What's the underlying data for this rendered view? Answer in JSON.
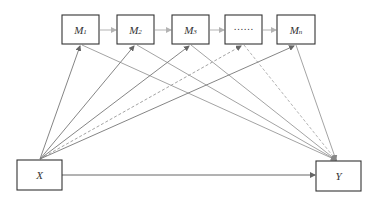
{
  "diagram": {
    "type": "multiple serial mediation model",
    "nodes": {
      "m1": {
        "main": "M",
        "sub": "1"
      },
      "m2": {
        "main": "M",
        "sub": "2"
      },
      "m3": {
        "main": "M",
        "sub": "3"
      },
      "ellipsis": {
        "main": "……",
        "sub": ""
      },
      "mn": {
        "main": "M",
        "sub": "n"
      },
      "x": {
        "main": "X",
        "sub": ""
      },
      "y": {
        "main": "Y",
        "sub": ""
      }
    },
    "edges": [
      {
        "from": "M1",
        "to": "M2",
        "style": "solid",
        "color": "#b3b3b3"
      },
      {
        "from": "M2",
        "to": "M3",
        "style": "solid",
        "color": "#b3b3b3"
      },
      {
        "from": "M3",
        "to": "……",
        "style": "solid",
        "color": "#b3b3b3"
      },
      {
        "from": "……",
        "to": "Mn",
        "style": "solid",
        "color": "#b3b3b3"
      },
      {
        "from": "X",
        "to": "M1",
        "style": "solid",
        "color": "#777777"
      },
      {
        "from": "X",
        "to": "M2",
        "style": "solid",
        "color": "#777777"
      },
      {
        "from": "X",
        "to": "M3",
        "style": "solid",
        "color": "#777777"
      },
      {
        "from": "X",
        "to": "……",
        "style": "dashed",
        "color": "#999999"
      },
      {
        "from": "X",
        "to": "Mn",
        "style": "solid",
        "color": "#777777"
      },
      {
        "from": "M1",
        "to": "Y",
        "style": "solid",
        "color": "#999999"
      },
      {
        "from": "M2",
        "to": "Y",
        "style": "solid",
        "color": "#999999"
      },
      {
        "from": "M3",
        "to": "Y",
        "style": "solid",
        "color": "#999999"
      },
      {
        "from": "……",
        "to": "Y",
        "style": "dashed",
        "color": "#aaaaaa"
      },
      {
        "from": "Mn",
        "to": "Y",
        "style": "solid",
        "color": "#999999"
      },
      {
        "from": "X",
        "to": "Y",
        "style": "solid",
        "color": "#666666"
      }
    ],
    "colors": {
      "box_border": "#333333",
      "chain_arrow": "#b3b3b3",
      "x_path": "#777777",
      "y_path": "#999999",
      "direct_path": "#666666"
    }
  }
}
